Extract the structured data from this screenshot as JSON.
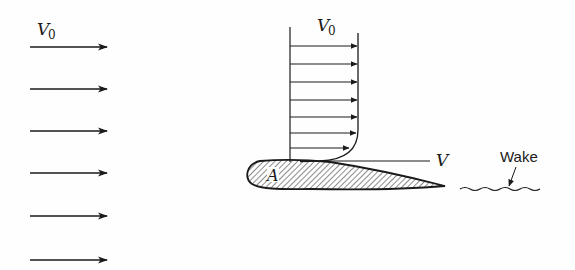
{
  "figure": {
    "free_stream": {
      "label_main": "V",
      "label_sub": "0",
      "arrow_count": 6
    },
    "boundary_layer_profile": {
      "label_main": "V",
      "label_sub": "0",
      "arrow_count": 7
    },
    "airfoil": {
      "point_label": "A"
    },
    "edge_velocity": {
      "label": "V"
    },
    "wake": {
      "label": "Wake"
    }
  }
}
